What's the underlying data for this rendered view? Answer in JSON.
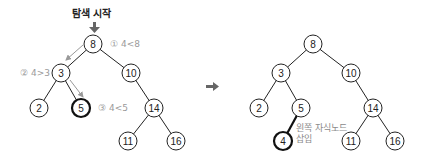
{
  "search_tree": {
    "title": "탐색 시작",
    "steps": [
      {
        "label": "① 4<8"
      },
      {
        "label": "② 4>3"
      },
      {
        "label": "③ 4<5"
      }
    ],
    "nodes": [
      {
        "value": "8"
      },
      {
        "value": "3"
      },
      {
        "value": "10"
      },
      {
        "value": "2"
      },
      {
        "value": "5"
      },
      {
        "value": "14"
      },
      {
        "value": "11"
      },
      {
        "value": "16"
      }
    ]
  },
  "result_tree": {
    "nodes": [
      {
        "value": "8"
      },
      {
        "value": "3"
      },
      {
        "value": "10"
      },
      {
        "value": "2"
      },
      {
        "value": "5"
      },
      {
        "value": "14"
      },
      {
        "value": "4"
      },
      {
        "value": "11"
      },
      {
        "value": "16"
      }
    ],
    "insert_note_line1": "왼쪽 자식노드",
    "insert_note_line2": "삽입"
  },
  "colors": {
    "node_stroke": "#222222",
    "highlight_stroke": "#111111",
    "annotation": "#9a9a9a",
    "arrow": "#888888"
  }
}
